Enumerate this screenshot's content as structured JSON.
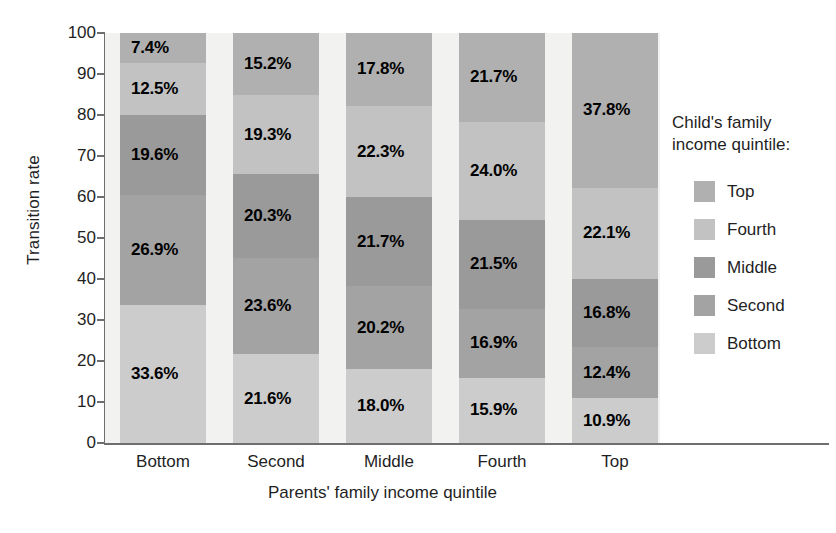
{
  "chart_data": {
    "type": "bar",
    "stacked": true,
    "stack_percent": true,
    "title": "",
    "xlabel": "Parents' family income quintile",
    "ylabel": "Transition rate",
    "categories": [
      "Bottom",
      "Second",
      "Middle",
      "Fourth",
      "Top"
    ],
    "ylim": [
      0,
      100
    ],
    "yticks": [
      0,
      10,
      20,
      30,
      40,
      50,
      60,
      70,
      80,
      90,
      100
    ],
    "grid": false,
    "legend_position": "right",
    "legend_title": "Child's family income quintile:",
    "legend_order": [
      "Top",
      "Fourth",
      "Middle",
      "Second",
      "Bottom"
    ],
    "series": [
      {
        "name": "Bottom",
        "color": "#cccccc",
        "values": [
          33.6,
          21.6,
          18.0,
          15.9,
          10.9
        ]
      },
      {
        "name": "Second",
        "color": "#a3a3a3",
        "values": [
          26.9,
          23.6,
          20.2,
          16.9,
          12.4
        ]
      },
      {
        "name": "Middle",
        "color": "#9a9a9a",
        "values": [
          19.6,
          20.3,
          21.7,
          21.5,
          16.8
        ]
      },
      {
        "name": "Fourth",
        "color": "#c2c2c2",
        "values": [
          12.5,
          19.3,
          22.3,
          24.0,
          22.1
        ]
      },
      {
        "name": "Top",
        "color": "#b0b0b0",
        "values": [
          7.4,
          15.2,
          17.8,
          21.7,
          37.8
        ]
      }
    ],
    "bars": [
      {
        "category": "Bottom",
        "segments": [
          {
            "name": "Top",
            "value": 7.4,
            "label": "7.4%",
            "color": "#b0b0b0"
          },
          {
            "name": "Fourth",
            "value": 12.5,
            "label": "12.5%",
            "color": "#c2c2c2"
          },
          {
            "name": "Middle",
            "value": 19.6,
            "label": "19.6%",
            "color": "#9a9a9a"
          },
          {
            "name": "Second",
            "value": 26.9,
            "label": "26.9%",
            "color": "#a3a3a3"
          },
          {
            "name": "Bottom",
            "value": 33.6,
            "label": "33.6%",
            "color": "#cccccc"
          }
        ]
      },
      {
        "category": "Second",
        "segments": [
          {
            "name": "Top",
            "value": 15.2,
            "label": "15.2%",
            "color": "#b0b0b0"
          },
          {
            "name": "Fourth",
            "value": 19.3,
            "label": "19.3%",
            "color": "#c2c2c2"
          },
          {
            "name": "Middle",
            "value": 20.3,
            "label": "20.3%",
            "color": "#9a9a9a"
          },
          {
            "name": "Second",
            "value": 23.6,
            "label": "23.6%",
            "color": "#a3a3a3"
          },
          {
            "name": "Bottom",
            "value": 21.6,
            "label": "21.6%",
            "color": "#cccccc"
          }
        ]
      },
      {
        "category": "Middle",
        "segments": [
          {
            "name": "Top",
            "value": 17.8,
            "label": "17.8%",
            "color": "#b0b0b0"
          },
          {
            "name": "Fourth",
            "value": 22.3,
            "label": "22.3%",
            "color": "#c2c2c2"
          },
          {
            "name": "Middle",
            "value": 21.7,
            "label": "21.7%",
            "color": "#9a9a9a"
          },
          {
            "name": "Second",
            "value": 20.2,
            "label": "20.2%",
            "color": "#a3a3a3"
          },
          {
            "name": "Bottom",
            "value": 18.0,
            "label": "18.0%",
            "color": "#cccccc"
          }
        ]
      },
      {
        "category": "Fourth",
        "segments": [
          {
            "name": "Top",
            "value": 21.7,
            "label": "21.7%",
            "color": "#b0b0b0"
          },
          {
            "name": "Fourth",
            "value": 24.0,
            "label": "24.0%",
            "color": "#c2c2c2"
          },
          {
            "name": "Middle",
            "value": 21.5,
            "label": "21.5%",
            "color": "#9a9a9a"
          },
          {
            "name": "Second",
            "value": 16.9,
            "label": "16.9%",
            "color": "#a3a3a3"
          },
          {
            "name": "Bottom",
            "value": 15.9,
            "label": "15.9%",
            "color": "#cccccc"
          }
        ]
      },
      {
        "category": "Top",
        "segments": [
          {
            "name": "Top",
            "value": 37.8,
            "label": "37.8%",
            "color": "#b0b0b0"
          },
          {
            "name": "Fourth",
            "value": 22.1,
            "label": "22.1%",
            "color": "#c2c2c2"
          },
          {
            "name": "Middle",
            "value": 16.8,
            "label": "16.8%",
            "color": "#9a9a9a"
          },
          {
            "name": "Second",
            "value": 12.4,
            "label": "12.4%",
            "color": "#a3a3a3"
          },
          {
            "name": "Bottom",
            "value": 10.9,
            "label": "10.9%",
            "color": "#cccccc"
          }
        ]
      }
    ]
  },
  "legend": {
    "title_line1": "Child's family",
    "title_line2": "income quintile:",
    "items": [
      {
        "label": "Top",
        "color": "#b0b0b0"
      },
      {
        "label": "Fourth",
        "color": "#c2c2c2"
      },
      {
        "label": "Middle",
        "color": "#9a9a9a"
      },
      {
        "label": "Second",
        "color": "#a3a3a3"
      },
      {
        "label": "Bottom",
        "color": "#cccccc"
      }
    ]
  },
  "axes": {
    "ylabel": "Transition rate",
    "xlabel": "Parents' family income quintile",
    "yticks": [
      "100",
      "90",
      "80",
      "70",
      "60",
      "50",
      "40",
      "30",
      "20",
      "10",
      "0"
    ],
    "xticks": [
      "Bottom",
      "Second",
      "Middle",
      "Fourth",
      "Top"
    ]
  },
  "colors": {
    "plot_background": "#f2f2f0",
    "axis": "#6e6e6e",
    "text": "#1f1f1f"
  }
}
